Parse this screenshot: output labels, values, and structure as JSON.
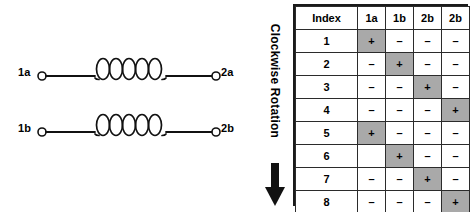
{
  "schematic": {
    "coils": [
      {
        "name": "coil-a",
        "left_terminal": "1a",
        "right_terminal": "2a",
        "turns": 5
      },
      {
        "name": "coil-b",
        "left_terminal": "1b",
        "right_terminal": "2b",
        "turns": 5
      }
    ]
  },
  "rotation": {
    "label": "Clockwise Rotation",
    "direction": "down",
    "arrow_glyph": "downward-arrow"
  },
  "table": {
    "headers": [
      "Index",
      "1a",
      "1b",
      "2b",
      "2b"
    ],
    "symbols": {
      "on": "+",
      "off": "–",
      "blank": ""
    },
    "highlight_color": "#a9a9a9",
    "rows": [
      {
        "index": "1",
        "values": [
          "+",
          "–",
          "–",
          "–"
        ]
      },
      {
        "index": "2",
        "values": [
          "–",
          "+",
          "–",
          "–"
        ]
      },
      {
        "index": "3",
        "values": [
          "–",
          "–",
          "+",
          "–"
        ]
      },
      {
        "index": "4",
        "values": [
          "–",
          "–",
          "–",
          "+"
        ]
      },
      {
        "index": "5",
        "values": [
          "+",
          "–",
          "–",
          "–"
        ]
      },
      {
        "index": "6",
        "values": [
          "",
          "+",
          "–",
          "–"
        ]
      },
      {
        "index": "7",
        "values": [
          "–",
          "–",
          "+",
          "–"
        ]
      },
      {
        "index": "8",
        "values": [
          "–",
          "–",
          "–",
          "+"
        ]
      }
    ]
  }
}
